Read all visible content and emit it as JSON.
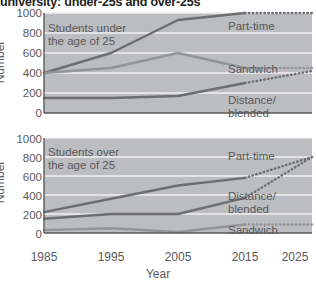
{
  "title": "university: under-25s and over-25s",
  "axis": {
    "ylabel": "Number",
    "xlabel": "Year",
    "yticks": [
      "1000",
      "800",
      "600",
      "400",
      "200",
      "0"
    ],
    "xticks": [
      "1985",
      "1995",
      "2005",
      "2015",
      "2025"
    ]
  },
  "panels": {
    "top": {
      "annotation": "Students under\nthe age of 25",
      "labels": {
        "part_time": "Part-time",
        "sandwich": "Sandwich",
        "distance": "Distance/\nblended"
      }
    },
    "bottom": {
      "annotation": "Students over\nthe age of 25",
      "labels": {
        "part_time": "Part-time",
        "distance": "Distance/\nblended",
        "sandwich": "Sandwich"
      }
    }
  },
  "colors": {
    "plot_background": "#bcbdc0",
    "gridline": "#f1f1f2",
    "dark_line": "#6d6e71",
    "mid_line": "#939598",
    "text": "#58595b",
    "title": "#231f20"
  },
  "chart_data": [
    {
      "type": "line",
      "title": "Students under the age of 25",
      "xlabel": "Year",
      "ylabel": "Number",
      "x": [
        1985,
        1995,
        2005,
        2015,
        2025
      ],
      "xlim": [
        1985,
        2025
      ],
      "ylim": [
        0,
        1000
      ],
      "yticks": [
        0,
        200,
        400,
        600,
        800,
        1000
      ],
      "grid": true,
      "legend": "inline-right",
      "forecast_from": 2015,
      "series": [
        {
          "name": "Part-time",
          "values": [
            400,
            600,
            930,
            1000,
            1000
          ],
          "style": "solid-to-dotted",
          "color": "#6d6e71"
        },
        {
          "name": "Sandwich",
          "values": [
            400,
            450,
            600,
            450,
            450
          ],
          "style": "solid-to-dotted",
          "color": "#939598"
        },
        {
          "name": "Distance/blended",
          "values": [
            150,
            150,
            170,
            300,
            420
          ],
          "style": "solid-to-dotted",
          "color": "#6d6e71"
        }
      ]
    },
    {
      "type": "line",
      "title": "Students over the age of 25",
      "xlabel": "Year",
      "ylabel": "Number",
      "x": [
        1985,
        1995,
        2005,
        2015,
        2025
      ],
      "xlim": [
        1985,
        2025
      ],
      "ylim": [
        0,
        1000
      ],
      "yticks": [
        0,
        200,
        400,
        600,
        800,
        1000
      ],
      "grid": true,
      "legend": "inline-right",
      "forecast_from": 2015,
      "series": [
        {
          "name": "Part-time",
          "values": [
            220,
            360,
            500,
            580,
            800
          ],
          "style": "solid-to-dotted",
          "color": "#6d6e71"
        },
        {
          "name": "Distance/blended",
          "values": [
            150,
            200,
            200,
            370,
            800
          ],
          "style": "solid-to-dotted",
          "color": "#6d6e71"
        },
        {
          "name": "Sandwich",
          "values": [
            30,
            50,
            10,
            90,
            90
          ],
          "style": "solid-to-dotted",
          "color": "#939598"
        }
      ]
    }
  ]
}
